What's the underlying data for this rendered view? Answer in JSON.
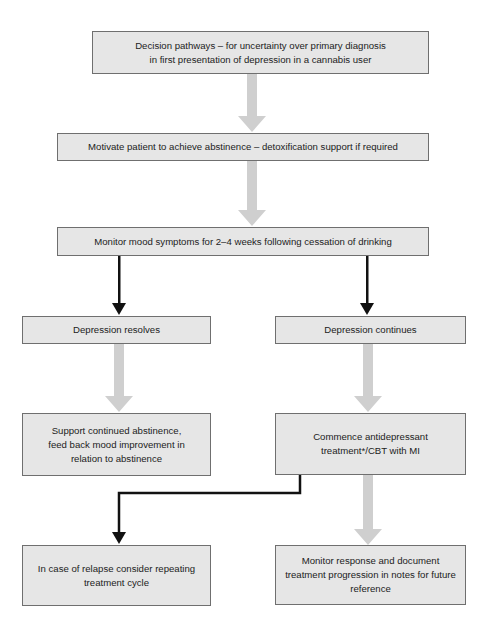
{
  "flowchart": {
    "title_box": {
      "lines": [
        "Decision pathways – for uncertainty over primary diagnosis",
        "in first presentation of depression in a cannabis user"
      ]
    },
    "step_motivate": {
      "lines": [
        "Motivate patient to achieve abstinence – detoxification support if required"
      ]
    },
    "step_monitor_mood": {
      "lines": [
        "Monitor mood symptoms for 2–4 weeks following cessation of drinking"
      ]
    },
    "branch_resolves": {
      "label": "Depression resolves",
      "next": {
        "lines": [
          "Support continued abstinence,",
          "feed back mood improvement in",
          "relation to abstinence"
        ]
      }
    },
    "branch_continues": {
      "label": "Depression continues",
      "next": {
        "lines": [
          "Commence antidepressant",
          "treatment*/CBT with MI"
        ]
      }
    },
    "relapse_box": {
      "lines": [
        "In case of relapse consider repeating",
        "treatment cycle"
      ]
    },
    "monitor_response_box": {
      "lines": [
        "Monitor response and document",
        "treatment progression in notes for future",
        "reference"
      ]
    },
    "colors": {
      "box_fill": "#e6e6e6",
      "box_border": "#6f6f6f",
      "gray_arrow": "#cfcfcf",
      "black_arrow": "#111111"
    }
  }
}
